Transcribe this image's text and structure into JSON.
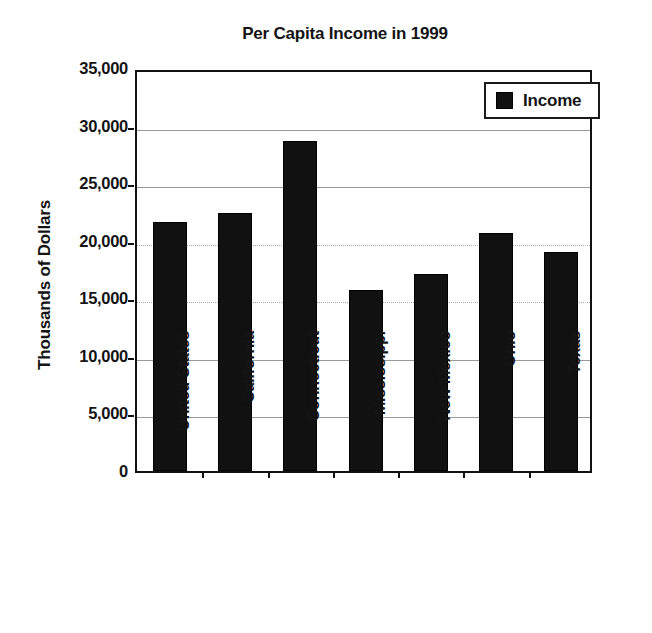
{
  "chart_data": {
    "type": "bar",
    "title": "Per Capita Income in 1999",
    "xlabel": "",
    "ylabel": "Thousands of Dollars",
    "categories": [
      "United States",
      "California",
      "Connecticut",
      "Mississippi",
      "New Mexico",
      "Ohio",
      "Texas"
    ],
    "series": [
      {
        "name": "Income",
        "color": "#111111",
        "values": [
          21600,
          22400,
          28700,
          15700,
          17100,
          20700,
          19000
        ]
      }
    ],
    "ylim": [
      0,
      35000
    ],
    "ytick_values": [
      0,
      5000,
      10000,
      15000,
      20000,
      25000,
      30000,
      35000
    ],
    "ytick_labels": [
      "0",
      "5,000",
      "10,000",
      "15,000",
      "20,000",
      "25,000",
      "30,000",
      "35,000"
    ],
    "grid": true,
    "legend_position": "top-right",
    "legend_entries": [
      "Income"
    ]
  },
  "legend": {
    "income_label": "Income"
  }
}
